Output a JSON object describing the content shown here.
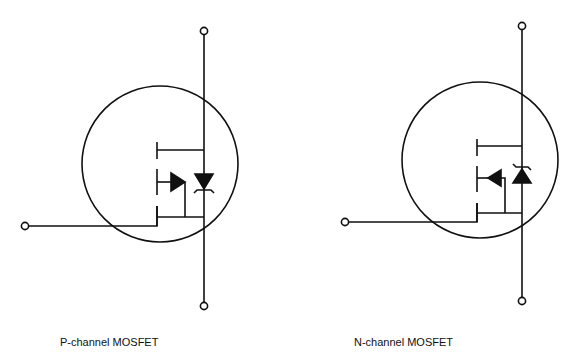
{
  "diagrams": [
    {
      "id": "p-channel",
      "caption": "P-channel MOSFET",
      "arrow_direction": "toward-body",
      "diode_direction": "down"
    },
    {
      "id": "n-channel",
      "caption": "N-channel MOSFET",
      "arrow_direction": "toward-gate",
      "diode_direction": "up"
    }
  ],
  "colors": {
    "line": "#111111",
    "background": "#ffffff"
  }
}
